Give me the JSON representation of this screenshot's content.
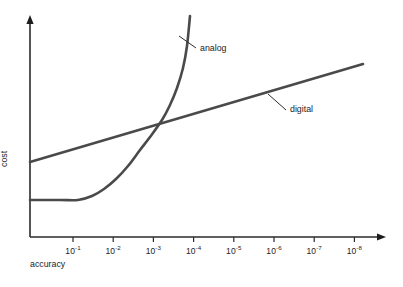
{
  "chart_data": {
    "type": "line",
    "title": "",
    "subtitle": "",
    "xlabel": "accuracy",
    "ylabel": "cost",
    "grid": false,
    "legend_position": "inline-annotations",
    "x_tick_labels": [
      "10-1",
      "10-2",
      "10-3",
      "10-4",
      "10-5",
      "10-6",
      "10-7",
      "10-8"
    ],
    "x_tick_mantissa": "10",
    "x_tick_exponents": [
      "-1",
      "-2",
      "-3",
      "-4",
      "-5",
      "-6",
      "-7",
      "-8"
    ],
    "y_tick_labels": [],
    "xlim": [
      "10-0.6",
      "10-8.7"
    ],
    "ylim": [
      0,
      1
    ],
    "axis_style": "arrow-headed open axes",
    "annotations": [
      {
        "text": "analog",
        "series": "analog",
        "leader_from_x": 179,
        "leader_from_y": 36,
        "leader_to_x": 196,
        "leader_to_y": 48
      },
      {
        "text": "digital",
        "series": "digital",
        "leader_from_x": 268,
        "leader_from_y": 94,
        "leader_to_x": 286,
        "leader_to_y": 110
      }
    ],
    "series": [
      {
        "name": "analog",
        "description": "flat low cost until about 10^-1 accuracy, then rises exponentially and steeply off the top of the chart shortly after 10^-4",
        "shape": "exponential",
        "color": "#4a4a4a",
        "points": [
          {
            "x": 30,
            "y": 200
          },
          {
            "x": 60,
            "y": 200
          },
          {
            "x": 78,
            "y": 200
          },
          {
            "x": 92,
            "y": 196
          },
          {
            "x": 104,
            "y": 189
          },
          {
            "x": 116,
            "y": 179
          },
          {
            "x": 128,
            "y": 166
          },
          {
            "x": 140,
            "y": 150
          },
          {
            "x": 150,
            "y": 137
          },
          {
            "x": 162,
            "y": 120
          },
          {
            "x": 170,
            "y": 105
          },
          {
            "x": 177,
            "y": 88
          },
          {
            "x": 183,
            "y": 68
          },
          {
            "x": 187,
            "y": 46
          },
          {
            "x": 190,
            "y": 16
          }
        ]
      },
      {
        "name": "digital",
        "description": "straight line of modest constant slope rising steadily from left to right across the full accuracy range",
        "shape": "linear",
        "color": "#4a4a4a",
        "points": [
          {
            "x": 30,
            "y": 162
          },
          {
            "x": 363,
            "y": 64
          }
        ]
      }
    ],
    "crossover": {
      "x": 162,
      "y": 126,
      "note": "analog overtakes digital near 10^-3"
    },
    "axes_geometry": {
      "origin_x": 30,
      "origin_y": 237,
      "x_axis_end": 385,
      "y_axis_top": 17,
      "first_tick_x": 73,
      "tick_spacing": 40.2,
      "tick_length": 5
    }
  }
}
